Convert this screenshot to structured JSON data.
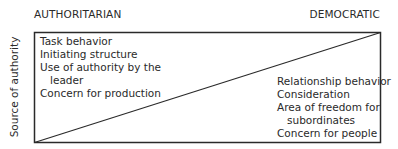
{
  "header": {
    "left": "AUTHORITARIAN",
    "right": "DEMOCRATIC"
  },
  "y_axis_label": "Source of authority",
  "left_items": [
    "Task behavior",
    "Initiating structure",
    "Use of authority by the",
    "leader",
    "Concern for production"
  ],
  "right_items": [
    "Relationship behavior",
    "Consideration",
    "Area of freedom for",
    "subordinates",
    "Concern for people"
  ],
  "colors": {
    "line": "#2a2a2a",
    "text": "#2a2a2a"
  }
}
